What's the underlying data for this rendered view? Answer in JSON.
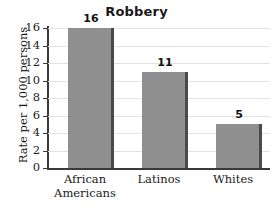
{
  "chart_data": {
    "type": "bar",
    "title": "Robbery",
    "xlabel": "",
    "ylabel": "Rate per 1,000 persons",
    "categories": [
      "African Americans",
      "Latinos",
      "Whites"
    ],
    "category_lines": [
      [
        "African",
        "Americans"
      ],
      [
        "Latinos"
      ],
      [
        "Whites"
      ]
    ],
    "values": [
      16,
      11,
      5
    ],
    "value_labels": [
      "16",
      "11",
      "5"
    ],
    "ylim": [
      0,
      16
    ],
    "yticks": [
      16,
      14,
      12,
      10,
      8,
      6,
      4,
      2,
      0
    ],
    "ytick_labels": [
      "16",
      "14",
      "12",
      "10",
      "8",
      "6",
      "4",
      "2",
      "0"
    ],
    "grid": "horizontal",
    "legend": "none",
    "bar_color": "#8f8f8f",
    "bar_edge_color": "#4a4a4a",
    "gridline_color": "#e3e3e3",
    "axis_color": "#3a3a3a",
    "background_color": "#ffffff",
    "text_color": "#1a1a1a"
  }
}
